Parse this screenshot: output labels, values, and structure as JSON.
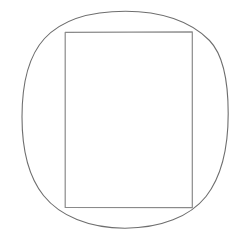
{
  "figure": {
    "title": "Rectangle inscribed in a circle",
    "canvas": {
      "width": 247,
      "height": 240,
      "background_color": "#ffffff"
    },
    "style": {
      "stroke_color": "#6e6e6e",
      "rect_stroke_color": "#8a8a8a",
      "stroke_width": 1.1,
      "rect_stroke_width": 1.2,
      "fill": "none",
      "appearance": "hand-drawn scanned pencil line art"
    },
    "shapes": [
      {
        "name": "circle",
        "type": "ellipse",
        "cx": 125,
        "cy": 119.5,
        "rx": 103,
        "ry": 108.5,
        "bounds": {
          "left": 22,
          "right": 228,
          "top": 11,
          "bottom": 228
        },
        "stroke_color": "#6e6e6e"
      },
      {
        "name": "rectangle",
        "type": "rect",
        "x": 65,
        "y": 32,
        "width": 127,
        "height": 175,
        "corners": [
          {
            "label": "top-left",
            "x": 65,
            "y": 32
          },
          {
            "label": "top-right",
            "x": 192,
            "y": 32
          },
          {
            "label": "bottom-right",
            "x": 192,
            "y": 207
          },
          {
            "label": "bottom-left",
            "x": 65,
            "y": 207
          }
        ],
        "stroke_color": "#8a8a8a"
      }
    ],
    "labels": []
  },
  "chart_data": {
    "type": "diagram",
    "title": "Rectangle inscribed in a circle",
    "xlabel": "",
    "ylabel": "",
    "grid": false,
    "legend": "none",
    "elements": [
      {
        "shape": "circle",
        "center_x": 125,
        "center_y": 119.5,
        "radius_x": 103,
        "radius_y": 108.5
      },
      {
        "shape": "rectangle",
        "left": 65,
        "top": 32,
        "right": 192,
        "bottom": 207,
        "width": 127,
        "height": 175
      }
    ],
    "annotations": []
  }
}
